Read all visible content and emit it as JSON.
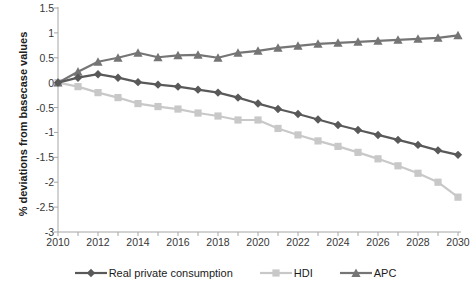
{
  "chart_data": {
    "type": "line",
    "title": "",
    "xlabel": "",
    "ylabel": "% deviations from basecase values",
    "xlim": [
      2010,
      2030
    ],
    "ylim": [
      -3,
      1.5
    ],
    "ytick_step": 0.5,
    "xtick_step": 1,
    "xtick_label_step": 2,
    "grid": false,
    "legend_position": "bottom",
    "x": [
      2010,
      2011,
      2012,
      2013,
      2014,
      2015,
      2016,
      2017,
      2018,
      2019,
      2020,
      2021,
      2022,
      2023,
      2024,
      2025,
      2026,
      2027,
      2028,
      2029,
      2030
    ],
    "x_tick_labels": [
      "2010",
      "",
      "2012",
      "",
      "2014",
      "",
      "2016",
      "",
      "2018",
      "",
      "2020",
      "",
      "2022",
      "",
      "2024",
      "",
      "2026",
      "",
      "2028",
      "",
      "2030"
    ],
    "y_tick_labels": [
      "1.5",
      "1",
      "0.5",
      "0",
      "-0.5",
      "-1",
      "-1.5",
      "-2",
      "-2.5",
      "-3"
    ],
    "y_tick_values": [
      1.5,
      1,
      0.5,
      0,
      -0.5,
      -1,
      -1.5,
      -2,
      -2.5,
      -3
    ],
    "series": [
      {
        "name": "Real private consumption",
        "color": "#595959",
        "marker": "diamond",
        "values": [
          0,
          0.1,
          0.17,
          0.1,
          0.01,
          -0.04,
          -0.08,
          -0.14,
          -0.2,
          -0.3,
          -0.42,
          -0.53,
          -0.63,
          -0.74,
          -0.85,
          -0.95,
          -1.05,
          -1.15,
          -1.25,
          -1.36,
          -1.45
        ]
      },
      {
        "name": "HDI",
        "color": "#c8c8c8",
        "marker": "square",
        "values": [
          0,
          -0.08,
          -0.2,
          -0.3,
          -0.42,
          -0.48,
          -0.53,
          -0.61,
          -0.67,
          -0.75,
          -0.75,
          -0.92,
          -1.05,
          -1.17,
          -1.28,
          -1.4,
          -1.53,
          -1.67,
          -1.82,
          -2.0,
          -2.3
        ]
      },
      {
        "name": "APC",
        "color": "#757575",
        "marker": "triangle",
        "values": [
          0,
          0.22,
          0.42,
          0.5,
          0.6,
          0.51,
          0.55,
          0.56,
          0.5,
          0.6,
          0.64,
          0.7,
          0.74,
          0.78,
          0.8,
          0.82,
          0.84,
          0.86,
          0.88,
          0.9,
          0.95
        ]
      }
    ]
  },
  "legend": {
    "items": [
      {
        "label": "Real private consumption"
      },
      {
        "label": "HDI"
      },
      {
        "label": "APC"
      }
    ]
  },
  "axis": {
    "y_title": "% deviations from basecase values"
  }
}
